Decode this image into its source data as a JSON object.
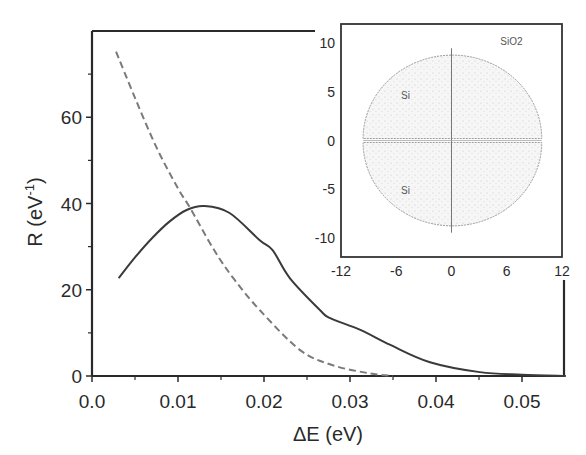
{
  "chart_data": [
    {
      "type": "line",
      "title": "",
      "xlabel": "ΔE (eV)",
      "ylabel_main": "R (eV",
      "ylabel_sup": "-1",
      "ylabel_close": ")",
      "xlim": [
        0.0,
        0.0551
      ],
      "ylim": [
        0,
        80
      ],
      "xticks": [
        0.0,
        0.01,
        0.02,
        0.03,
        0.04,
        0.05
      ],
      "xtick_labels": [
        "0.0",
        "0.01",
        "0.02",
        "0.03",
        "0.04",
        "0.05"
      ],
      "xminor": [
        0.005,
        0.015,
        0.025,
        0.035,
        0.045
      ],
      "yticks": [
        0,
        20,
        40,
        60
      ],
      "ytick_labels": [
        "0",
        "20",
        "40",
        "60"
      ],
      "yminor": [
        10,
        30,
        50,
        70
      ],
      "grid": false,
      "legend": "none",
      "series": [
        {
          "name": "solid",
          "style": "solid",
          "color": "#3a3a3a",
          "x": [
            0.0031,
            0.005,
            0.007,
            0.009,
            0.011,
            0.0131,
            0.016,
            0.0195,
            0.021,
            0.023,
            0.0265,
            0.0277,
            0.0312,
            0.0347,
            0.0393,
            0.0451,
            0.05,
            0.0551
          ],
          "y": [
            22.7,
            27.5,
            32.0,
            35.8,
            38.5,
            39.4,
            37.8,
            31.5,
            29.2,
            22.7,
            15.3,
            13.4,
            10.7,
            7.2,
            3.2,
            0.9,
            0.3,
            0.0
          ]
        },
        {
          "name": "dashed",
          "style": "dashed",
          "color": "#7a7a7a",
          "x": [
            0.0028,
            0.005,
            0.0075,
            0.01,
            0.0114,
            0.0142,
            0.0165,
            0.0195,
            0.0242,
            0.028,
            0.0323,
            0.035
          ],
          "y": [
            75.2,
            64.5,
            53.0,
            43.5,
            39.0,
            29.2,
            22.5,
            15.3,
            6.0,
            2.5,
            0.6,
            0.0
          ]
        }
      ]
    },
    {
      "type": "scatter",
      "title": "inset",
      "xlim": [
        -12,
        12
      ],
      "ylim": [
        -12,
        12
      ],
      "xticks": [
        -12,
        -6,
        0,
        6,
        12
      ],
      "xtick_labels": [
        "-12",
        "-6",
        "0",
        "6",
        "12"
      ],
      "yticks": [
        -10,
        -5,
        0,
        5,
        10
      ],
      "ytick_labels": [
        "-10",
        "-5",
        "0",
        "5",
        "10"
      ],
      "annotations": [
        {
          "text": "SiO2",
          "x": 6.5,
          "y": 10.3
        },
        {
          "text": "Si",
          "x": -5.0,
          "y": 4.7
        },
        {
          "text": "Si",
          "x": -5.0,
          "y": -5.1
        }
      ],
      "regions": [
        {
          "name": "upper-lobe",
          "x_min": -9.6,
          "x_max": 9.8,
          "y_flat": 0.2,
          "y_peak": 8.8
        },
        {
          "name": "lower-lobe",
          "x_min": -9.6,
          "x_max": 9.8,
          "y_flat": -0.2,
          "y_peak": -8.8
        }
      ],
      "crosshair": {
        "x": 0,
        "y": 0,
        "y_extent": [
          -9.5,
          9.5
        ]
      }
    }
  ]
}
